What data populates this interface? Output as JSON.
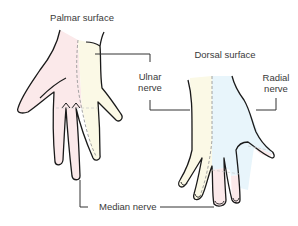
{
  "figure": {
    "type": "anatomical hand diagram",
    "palmar_title": "Palmar surface",
    "dorsal_title": "Dorsal surface",
    "labels": {
      "ulnar_line1": "Ulnar",
      "ulnar_line2": "nerve",
      "radial_line1": "Radial",
      "radial_line2": "nerve",
      "median": "Median nerve"
    },
    "regions": [
      {
        "nerve": "Median nerve",
        "color": "#fbe9ea",
        "areas": [
          "palmar: thumb, index, middle, radial half of ring finger",
          "dorsal: fingertips of index, middle, radial half of ring"
        ]
      },
      {
        "nerve": "Ulnar nerve",
        "color": "#fbf9e6",
        "areas": [
          "palmar: little finger and ulnar half of ring finger",
          "dorsal: ulnar side of hand, little finger, ulnar half of ring"
        ]
      },
      {
        "nerve": "Radial nerve",
        "color": "#e8f5fb",
        "areas": [
          "dorsal: radial side of hand, thumb, proximal index/middle/ring"
        ]
      }
    ],
    "colors": {
      "median": "#fbe9ea",
      "ulnar": "#fbf9e6",
      "radial": "#e8f5fb",
      "outline": "#1a1a1a",
      "boundary_dash": "#9a9a9a",
      "leader_line": "#333333",
      "text": "#3a3a3a"
    }
  }
}
